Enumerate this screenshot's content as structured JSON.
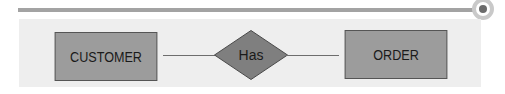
{
  "diagram": {
    "type": "entity-relationship",
    "entities": [
      {
        "id": "customer",
        "label": "CUSTOMER"
      },
      {
        "id": "order",
        "label": "ORDER"
      }
    ],
    "relationships": [
      {
        "label": "Has",
        "from": "CUSTOMER",
        "to": "ORDER"
      }
    ]
  },
  "colors": {
    "entity_fill": "#9c9c9c",
    "relationship_fill": "#7f7f7f",
    "panel_bg": "#eeeeee",
    "top_bar": "#a3a3a3",
    "ring": "#c9c9c9",
    "ring_dot": "#6b6b6b"
  }
}
